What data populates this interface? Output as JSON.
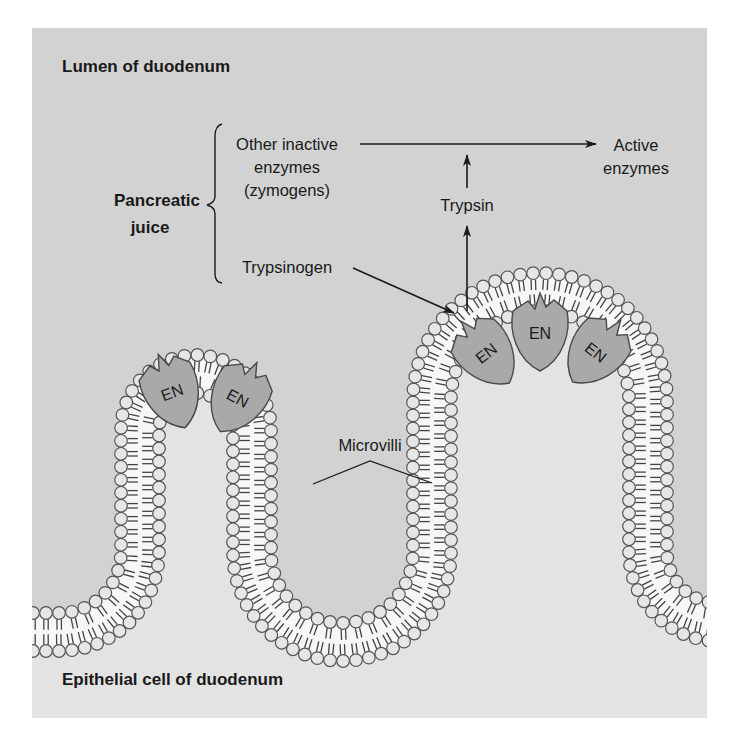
{
  "figure": {
    "panel": {
      "x": 32,
      "y": 28,
      "width": 675,
      "height": 690
    },
    "colors": {
      "page_background": "#ffffff",
      "lumen_background": "#d2d2d2",
      "cell_interior": "#e3e3e3",
      "membrane_core": "#f7f7f7",
      "head_fill": "#e6e6e6",
      "head_stroke": "#555555",
      "tail_stroke": "#444444",
      "enzyme_fill": "#a9a9a9",
      "enzyme_stroke": "#4a4a4a",
      "text": "#1a1a1a",
      "arrow": "#1a1a1a"
    }
  },
  "labels": {
    "lumen": "Lumen of duodenum",
    "epithelial": "Epithelial cell of duodenum",
    "pancreatic_juice_line1": "Pancreatic",
    "pancreatic_juice_line2": "juice",
    "other_inactive_line1": "Other inactive",
    "other_inactive_line2": "enzymes",
    "other_inactive_line3": "(zymogens)",
    "trypsinogen": "Trypsinogen",
    "trypsin": "Trypsin",
    "active_line1": "Active",
    "active_line2": "enzymes",
    "microvilli": "Microvilli"
  },
  "enzymes": [
    {
      "label": "EN",
      "cx": 172,
      "cy": 392,
      "rotate": -20
    },
    {
      "label": "EN",
      "cx": 238,
      "cy": 398,
      "rotate": 28
    },
    {
      "label": "EN",
      "cx": 486,
      "cy": 353,
      "rotate": -38
    },
    {
      "label": "EN",
      "cx": 540,
      "cy": 333,
      "rotate": 0
    },
    {
      "label": "EN",
      "cx": 596,
      "cy": 352,
      "rotate": 38
    }
  ],
  "flow": {
    "arrows": [
      {
        "name": "zymogens-to-active-arrow",
        "from": "Other inactive enzymes",
        "to": "Active enzymes"
      },
      {
        "name": "trypsin-up-arrow",
        "from": "Trypsin",
        "to": "activation line"
      },
      {
        "name": "trypsinogen-to-enzyme-arrow",
        "from": "Trypsinogen",
        "to": "EN"
      },
      {
        "name": "enzyme-to-trypsin-arrow",
        "from": "EN",
        "to": "Trypsin"
      }
    ]
  }
}
